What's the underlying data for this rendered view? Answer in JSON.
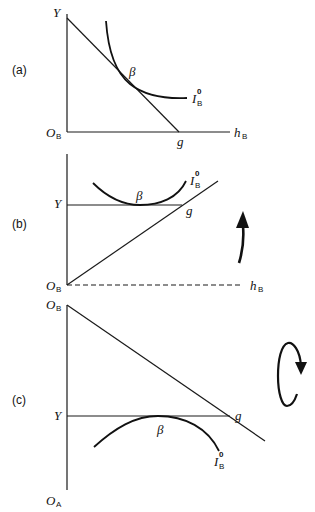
{
  "panels": [
    {
      "id": "a",
      "label": "(a)",
      "axis_origin": "O",
      "axis_origin_sub": "B",
      "y_label": "Y",
      "x_label": "h",
      "x_label_sub": "B",
      "point_g": "g",
      "point_beta": "β",
      "curve_label": "I",
      "curve_label_sup": "0",
      "curve_label_sub": "B"
    },
    {
      "id": "b",
      "label": "(b)",
      "axis_origin": "O",
      "axis_origin_sub": "B",
      "y_label": "Y",
      "x_label": "h",
      "x_label_sub": "B",
      "point_g": "g",
      "point_beta": "β",
      "curve_label": "I",
      "curve_label_sup": "0",
      "curve_label_sub": "B",
      "annotation": "curved-up-arrow"
    },
    {
      "id": "c",
      "label": "(c)",
      "top_origin": "O",
      "top_origin_sub": "B",
      "bottom_origin": "O",
      "bottom_origin_sub": "A",
      "y_label": "Y",
      "point_g": "g",
      "point_beta": "β",
      "curve_label": "I",
      "curve_label_sup": "0",
      "curve_label_sub": "B",
      "annotation": "clockwise-rotation-arrow"
    }
  ],
  "colors": {
    "ink": "#111111",
    "background": "#ffffff"
  }
}
